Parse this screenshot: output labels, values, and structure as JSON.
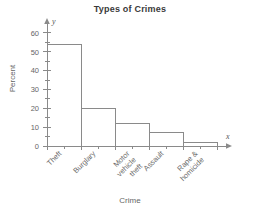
{
  "chart_data": {
    "type": "bar",
    "title": "Types of Crimes",
    "xlabel": "Crime",
    "ylabel": "Percent",
    "categories": [
      "Theft",
      "Burglary",
      "Motor\nvehicle\ntheft",
      "Assault",
      "Rape &\nhomicide"
    ],
    "values": [
      54,
      20,
      12,
      7,
      2
    ],
    "ylim": [
      0,
      65
    ],
    "yticks": [
      0,
      10,
      20,
      30,
      40,
      50,
      60
    ],
    "ytick_labels": [
      "0",
      "10",
      "20",
      "30",
      "40",
      "50",
      "60"
    ],
    "minor_tick_step": 5,
    "grid": false,
    "legend": null,
    "axis_variable_x": "x",
    "axis_variable_y": "y",
    "style": {
      "bar_fill": "none",
      "bar_stroke": "#8a8a8a",
      "axis_color": "#8a8a8a",
      "text_color": "#666666",
      "title_color": "#3a3a3a",
      "background": "#ffffff"
    }
  },
  "category_lines": [
    [
      "Theft"
    ],
    [
      "Burglary"
    ],
    [
      "Motor",
      "vehicle",
      "theft"
    ],
    [
      "Assault"
    ],
    [
      "Rape &",
      "homicide"
    ]
  ]
}
